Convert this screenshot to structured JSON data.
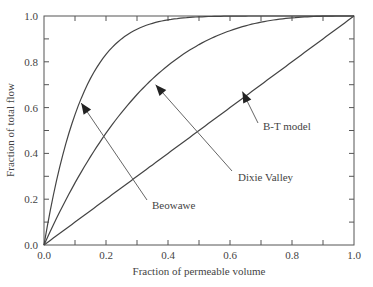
{
  "chart_data": {
    "type": "line",
    "title": "",
    "xlabel": "Fraction of permeable volume",
    "ylabel": "Fraction of total flow",
    "xlim": [
      0,
      1
    ],
    "ylim": [
      0,
      1
    ],
    "xticks": [
      "0.0",
      "0.2",
      "0.4",
      "0.6",
      "0.8",
      "1.0"
    ],
    "yticks": [
      "0.0",
      "0.2",
      "0.4",
      "0.6",
      "0.8",
      "1.0"
    ],
    "grid": false,
    "series": [
      {
        "name": "Beowawe",
        "x": [
          0,
          0.05,
          0.1,
          0.2,
          0.3,
          0.4,
          0.5,
          0.6,
          0.7,
          0.8,
          0.9,
          1.0
        ],
        "y": [
          0,
          0.34,
          0.57,
          0.83,
          0.94,
          0.98,
          0.99,
          1.0,
          1.0,
          1.0,
          1.0,
          1.0
        ]
      },
      {
        "name": "Dixie Valley",
        "x": [
          0,
          0.05,
          0.1,
          0.2,
          0.3,
          0.4,
          0.5,
          0.6,
          0.7,
          0.8,
          0.9,
          1.0
        ],
        "y": [
          0,
          0.14,
          0.27,
          0.49,
          0.66,
          0.78,
          0.87,
          0.94,
          0.97,
          0.99,
          1.0,
          1.0
        ]
      },
      {
        "name": "B-T model",
        "x": [
          0,
          1
        ],
        "y": [
          0,
          1
        ]
      }
    ],
    "annotations": [
      {
        "text": "Beowawe",
        "points_to": [
          0.12,
          0.62
        ]
      },
      {
        "text": "Dixie Valley",
        "points_to": [
          0.36,
          0.7
        ]
      },
      {
        "text": "B-T model",
        "points_to": [
          0.64,
          0.67
        ]
      }
    ]
  }
}
